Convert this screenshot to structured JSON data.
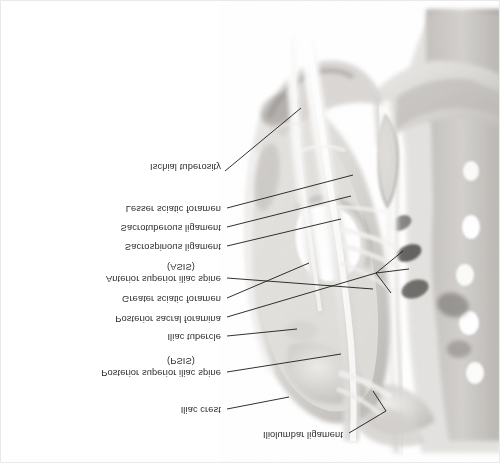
{
  "figure": {
    "background_color": "#ffffff",
    "text_color": "#2b2b2b",
    "leader_color": "#1b1b1b",
    "bone_light": "#e4e3e1",
    "bone_mid": "#c9c7c4",
    "bone_dark": "#9d9a97",
    "bone_shadow": "#6f6c6a",
    "ligament_color": "#f2f1ef",
    "text_orientation": "mirrored-vertically"
  },
  "labels": [
    {
      "id": "ischial-tuberosity",
      "text": "Ischial tuberosity",
      "x": 128,
      "y": 160,
      "align": "right",
      "width": 92,
      "leader": [
        [
          224,
          170
        ],
        [
          300,
          107
        ]
      ]
    },
    {
      "id": "lesser-sciatic-foramen",
      "text": "Lesser sciatic foramen",
      "x": 56,
      "y": 202,
      "align": "right",
      "width": 164,
      "leader": [
        [
          226,
          207
        ],
        [
          352,
          174
        ]
      ]
    },
    {
      "id": "sacrotuberous-ligament",
      "text": "Sacrotuberous ligament",
      "x": 48,
      "y": 221,
      "align": "right",
      "width": 172,
      "leader": [
        [
          226,
          226
        ],
        [
          350,
          195
        ]
      ]
    },
    {
      "id": "sacrospinous-ligament",
      "text": "Sacrospinous ligament",
      "x": 52,
      "y": 240,
      "align": "right",
      "width": 168,
      "leader": [
        [
          226,
          245
        ],
        [
          340,
          218
        ]
      ]
    },
    {
      "id": "asis-abbrev",
      "text": "(ASIS)",
      "x": 140,
      "y": 260,
      "align": "center",
      "width": 80,
      "leader": null
    },
    {
      "id": "anterior-superior-iliac-spine",
      "text": "Anterior superior iliac spine",
      "x": 20,
      "y": 272,
      "align": "right",
      "width": 200,
      "leader": [
        [
          226,
          277
        ],
        [
          372,
          288
        ]
      ]
    },
    {
      "id": "greater-sciatic-foramen",
      "text": "Greater sciatic foramen",
      "x": 44,
      "y": 292,
      "align": "right",
      "width": 176,
      "leader": [
        [
          226,
          297
        ],
        [
          308,
          262
        ]
      ]
    },
    {
      "id": "posterior-sacral-foramina",
      "text": "Posterior sacral foramina",
      "x": 38,
      "y": 312,
      "align": "right",
      "width": 182,
      "leader": [
        [
          226,
          316
        ],
        [
          375,
          272
        ]
      ]
    },
    {
      "id": "iliac-tubercle",
      "text": "Iliac tubercle",
      "x": 126,
      "y": 330,
      "align": "right",
      "width": 94,
      "leader": [
        [
          226,
          335
        ],
        [
          296,
          328
        ]
      ]
    },
    {
      "id": "psis-abbrev",
      "text": "(PSIS)",
      "x": 140,
      "y": 354,
      "align": "center",
      "width": 80,
      "leader": null
    },
    {
      "id": "posterior-superior-iliac-spine",
      "text": "Posterior superior iliac spine",
      "x": 16,
      "y": 366,
      "align": "right",
      "width": 204,
      "leader": [
        [
          226,
          371
        ],
        [
          340,
          353
        ]
      ]
    },
    {
      "id": "iliac-crest",
      "text": "Iliac crest",
      "x": 134,
      "y": 403,
      "align": "right",
      "width": 86,
      "leader": [
        [
          226,
          408
        ],
        [
          288,
          396
        ]
      ]
    },
    {
      "id": "iliolumbar-ligament",
      "text": "Iliolumbar ligament",
      "x": 196,
      "y": 428,
      "align": "right",
      "width": 146,
      "leader": [
        [
          348,
          432
        ],
        [
          385,
          410
        ]
      ]
    }
  ],
  "leader_extras": [
    {
      "id": "sacral-foramina-branch-1",
      "points": [
        [
          375,
          272
        ],
        [
          402,
          250
        ]
      ]
    },
    {
      "id": "sacral-foramina-branch-2",
      "points": [
        [
          375,
          272
        ],
        [
          408,
          268
        ]
      ]
    },
    {
      "id": "sacral-foramina-branch-3",
      "points": [
        [
          375,
          272
        ],
        [
          390,
          292
        ]
      ]
    },
    {
      "id": "iliolumbar-branch",
      "points": [
        [
          385,
          410
        ],
        [
          372,
          390
        ]
      ]
    }
  ]
}
